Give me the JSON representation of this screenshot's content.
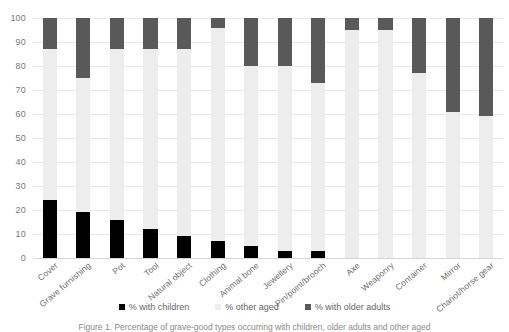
{
  "chart_data": {
    "type": "bar",
    "stacked": true,
    "title": "",
    "subtitle": "",
    "xlabel": "",
    "ylabel": "",
    "ylim": [
      0,
      100
    ],
    "ytick_labels": [
      "100",
      "90",
      "80",
      "70",
      "60",
      "50",
      "40",
      "30",
      "20",
      "10",
      "0"
    ],
    "ytick_values": [
      100,
      90,
      80,
      70,
      60,
      50,
      40,
      30,
      20,
      10,
      0
    ],
    "grid": true,
    "legend_position": "bottom",
    "categories": [
      "Cover",
      "Grave furnishing",
      "Pot",
      "Tool",
      "Natural object",
      "Clothing",
      "Animal bone",
      "Jewellery",
      "Pin/point/brooch",
      "Axe",
      "Weaponry",
      "Container",
      "Mirror",
      "Chariot/horse gear"
    ],
    "series": [
      {
        "name": "% with children",
        "color": "#000000",
        "values": [
          24,
          19,
          16,
          12,
          9,
          7,
          5,
          3,
          3,
          0,
          0,
          0,
          0,
          0
        ]
      },
      {
        "name": "% other aged",
        "color": "#ededed",
        "values": [
          63,
          56,
          71,
          75,
          78,
          89,
          75,
          77,
          70,
          95,
          95,
          77,
          61,
          59
        ]
      },
      {
        "name": "% with older adults",
        "color": "#595959",
        "values": [
          13,
          25,
          13,
          13,
          13,
          4,
          20,
          20,
          27,
          5,
          5,
          23,
          39,
          41
        ]
      }
    ]
  },
  "legend": {
    "items": [
      {
        "label": "% with children",
        "swatch": "sw-children"
      },
      {
        "label": "% other aged",
        "swatch": "sw-other"
      },
      {
        "label": "% with older adults",
        "swatch": "sw-older"
      }
    ]
  },
  "caption": {
    "text": "Figure 1. Percentage of grave-good types occurring with children, older adults and other aged"
  }
}
